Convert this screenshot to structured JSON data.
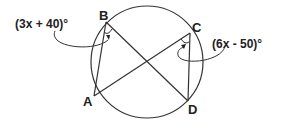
{
  "diagram": {
    "type": "circle-inscribed-angles",
    "points": {
      "A": {
        "label": "A",
        "x": 94,
        "y": 96
      },
      "B": {
        "label": "B",
        "x": 106,
        "y": 22
      },
      "C": {
        "label": "C",
        "x": 190,
        "y": 33
      },
      "D": {
        "label": "D",
        "x": 188,
        "y": 101
      }
    },
    "circle": {
      "cx": 147,
      "cy": 62,
      "r": 56
    },
    "segments": [
      "AB",
      "BD",
      "AC",
      "CD"
    ],
    "angles": {
      "B": {
        "expression": "(3x + 40)°",
        "vertex": "B"
      },
      "C": {
        "expression": "(6x - 50)°",
        "vertex": "C"
      }
    },
    "line_color": "#333333"
  }
}
